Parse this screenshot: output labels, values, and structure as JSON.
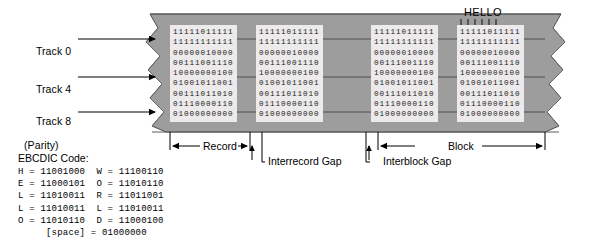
{
  "diagram": {
    "colors": {
      "tape_fill": "#9d9d9d",
      "tape_edge": "#6b6b6b",
      "data_background": "#eceaea",
      "text": "#000000",
      "line": "#000000"
    }
  },
  "track_labels": [
    {
      "name": "track-0",
      "text": "Track 0"
    },
    {
      "name": "track-4",
      "text": "Track 4"
    },
    {
      "name": "track-8",
      "text": "Track 8",
      "sub": "(Parity)"
    }
  ],
  "hello_callout": {
    "label": "HELLO",
    "tick_count": 6
  },
  "bit_rows": [
    "11111011111",
    "11111111111",
    "00000010000",
    "00111001110",
    "10000000100",
    "01001011001",
    "00111011010",
    "01110000110",
    "01000000000"
  ],
  "blocks": [
    {
      "name": "data-block-1"
    },
    {
      "name": "data-block-2"
    },
    {
      "name": "data-block-3"
    },
    {
      "name": "data-block-4"
    }
  ],
  "annotations": {
    "record": "Record",
    "interrecord_gap": "Interrecord Gap",
    "interblock_gap": "Interblock Gap",
    "block": "Block"
  },
  "ebcdic": {
    "title": "EBCDIC Code:",
    "rows": [
      "H = 11001000  W = 11100110",
      "E = 11000101  O = 11010110",
      "L = 11010011  R = 11011001",
      "L = 11010011  L = 11010011",
      "O = 11010110  D = 11000100"
    ],
    "space_row": "[space] = 01000000"
  }
}
